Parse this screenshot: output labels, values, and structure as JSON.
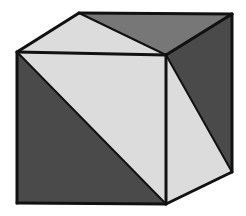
{
  "figure": {
    "type": "line-drawing",
    "canvas": {
      "width": 246,
      "height": 216
    },
    "background_color": "#ffffff",
    "outline_color": "#111111",
    "outline_width": 3,
    "inner_split_width": 2,
    "palette": {
      "light_gray": "#dcdcdc",
      "medium_gray": "#777777",
      "dark_gray": "#4a4a4a",
      "outline": "#111111",
      "background": "#ffffff"
    },
    "vertices": {
      "top_back": {
        "x": 79,
        "y": 13
      },
      "top_right_back": {
        "x": 232,
        "y": 14
      },
      "left_upper": {
        "x": 17,
        "y": 52
      },
      "center_top": {
        "x": 166,
        "y": 55
      },
      "left_lower": {
        "x": 17,
        "y": 203
      },
      "center_bottom": {
        "x": 166,
        "y": 204
      },
      "right_lower": {
        "x": 232,
        "y": 172
      }
    },
    "faces": [
      {
        "name": "top-face",
        "label": "Top face",
        "outline_points": "79,13 232,14 166,55 17,52",
        "split_line": "79,13 166,55",
        "triangles": [
          {
            "name": "top-face-light-triangle",
            "label": "Top face light triangle",
            "points": "79,13 166,55 17,52",
            "fill": "#dcdcdc",
            "tone": "light"
          },
          {
            "name": "top-face-dark-triangle",
            "label": "Top face dark triangle",
            "points": "79,13 232,14 166,55",
            "fill": "#777777",
            "tone": "medium"
          }
        ]
      },
      {
        "name": "front-face",
        "label": "Front face",
        "outline_points": "17,52 166,55 166,204 17,203",
        "split_line": "17,52 166,204",
        "triangles": [
          {
            "name": "front-face-dark-triangle",
            "label": "Front face dark triangle",
            "points": "17,52 166,204 17,203",
            "fill": "#4a4a4a",
            "tone": "dark"
          },
          {
            "name": "front-face-light-triangle",
            "label": "Front face light triangle",
            "points": "17,52 166,55 166,204",
            "fill": "#dcdcdc",
            "tone": "light"
          }
        ]
      },
      {
        "name": "right-face",
        "label": "Right side face",
        "outline_points": "166,55 232,14 232,172 166,204",
        "split_line": "166,55 232,172",
        "triangles": [
          {
            "name": "right-face-light-triangle",
            "label": "Right face light triangle",
            "points": "166,55 232,172 166,204",
            "fill": "#dcdcdc",
            "tone": "light"
          },
          {
            "name": "right-face-dark-triangle",
            "label": "Right face dark triangle",
            "points": "166,55 232,14 232,172",
            "fill": "#4a4a4a",
            "tone": "dark"
          }
        ]
      }
    ],
    "edges": [
      {
        "name": "edge-top-back-left",
        "path": "M17,52 L79,13"
      },
      {
        "name": "edge-top-back-right",
        "path": "M79,13 L232,14"
      },
      {
        "name": "edge-top-right-down",
        "path": "M232,14 L166,55"
      },
      {
        "name": "edge-top-front-left",
        "path": "M166,55 L17,52"
      },
      {
        "name": "edge-vertical-left",
        "path": "M17,52 L17,203"
      },
      {
        "name": "edge-vertical-center",
        "path": "M166,55 L166,204"
      },
      {
        "name": "edge-vertical-right",
        "path": "M232,14 L232,172"
      },
      {
        "name": "edge-bottom-front",
        "path": "M17,203 L166,204"
      },
      {
        "name": "edge-bottom-right",
        "path": "M166,204 L232,172"
      }
    ],
    "split_lines": [
      {
        "name": "split-top-face",
        "path": "M79,13 L166,55"
      },
      {
        "name": "split-front-face",
        "path": "M17,52 L166,204"
      },
      {
        "name": "split-right-face",
        "path": "M166,55 L232,172"
      }
    ]
  }
}
